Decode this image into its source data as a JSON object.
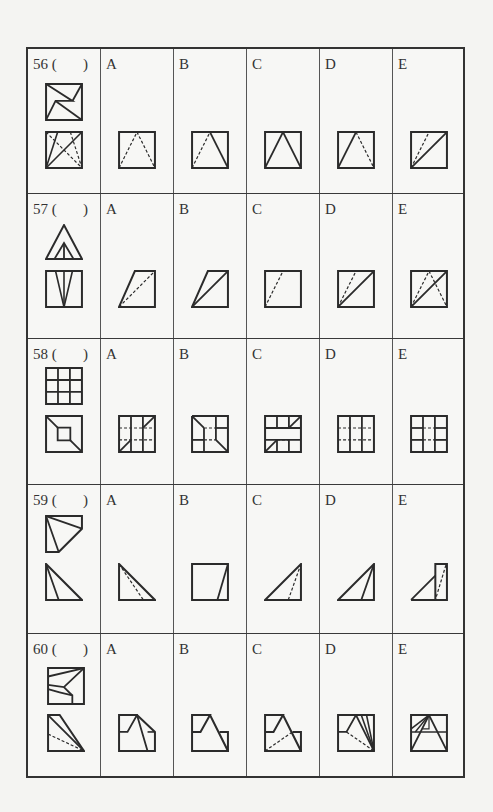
{
  "columns": [
    "question",
    "A",
    "B",
    "C",
    "D",
    "E"
  ],
  "questions": [
    {
      "number": "56",
      "label": "56 (       )",
      "options": [
        {
          "letter": "A",
          "description": "square with dashed inverted-V from top center to bottom corners"
        },
        {
          "letter": "B",
          "description": "square with dashed left leg and solid right leg of inverted-V"
        },
        {
          "letter": "C",
          "description": "square with solid inverted-V"
        },
        {
          "letter": "D",
          "description": "square with solid left leg and dashed right leg of inverted-V"
        },
        {
          "letter": "E",
          "description": "square with solid diagonal and dashed line from bottom-left to top center"
        }
      ]
    },
    {
      "number": "57",
      "label": "57 (       )",
      "options": [
        {
          "letter": "A",
          "description": "parallelogram-trapezoid with dashed diagonal"
        },
        {
          "letter": "B",
          "description": "trapezoid with solid diagonal"
        },
        {
          "letter": "C",
          "description": "square with dashed line from bottom-left up to top"
        },
        {
          "letter": "D",
          "description": "square with solid diagonal and dashed line"
        },
        {
          "letter": "E",
          "description": "square with solid diagonal and dashed inverted-V"
        }
      ]
    },
    {
      "number": "58",
      "label": "58 (       )",
      "options": [
        {
          "letter": "A",
          "description": "3x3 grid with dashed middle lines and corner diagonals"
        },
        {
          "letter": "B",
          "description": "3x3 grid with cut corners and dashed center"
        },
        {
          "letter": "C",
          "description": "3x3 grid with open middle row and corner diagonals"
        },
        {
          "letter": "D",
          "description": "3x3 grid with dashed horizontal inner lines"
        },
        {
          "letter": "E",
          "description": "3x3 grid with dashed center segments"
        }
      ]
    },
    {
      "number": "59",
      "label": "59 (       )",
      "options": [
        {
          "letter": "A",
          "description": "right triangle with dashed inner line"
        },
        {
          "letter": "B",
          "description": "square with slanted line near right edge"
        },
        {
          "letter": "C",
          "description": "right triangle with dashed inner line"
        },
        {
          "letter": "D",
          "description": "right triangle with solid inner line"
        },
        {
          "letter": "E",
          "description": "triangle with rectangle and dashed diagonal"
        }
      ]
    },
    {
      "number": "60",
      "label": "60 (       )",
      "options": [
        {
          "letter": "A",
          "description": "stepped pentagon with folded peak"
        },
        {
          "letter": "B",
          "description": "stepped outline with peak"
        },
        {
          "letter": "C",
          "description": "stepped outline with dashed line"
        },
        {
          "letter": "D",
          "description": "square with fan lines and dashed line"
        },
        {
          "letter": "E",
          "description": "square with triangle and inner lines"
        }
      ]
    }
  ],
  "colors": {
    "background": "#f4f4f2",
    "line": "#2b2b2b"
  }
}
